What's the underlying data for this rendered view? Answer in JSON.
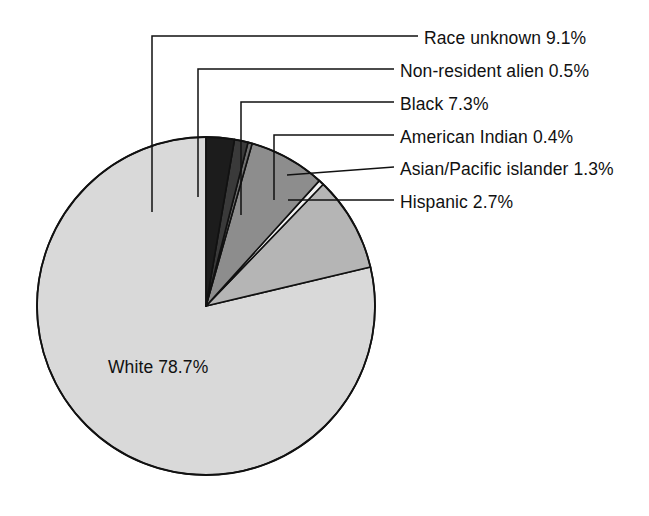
{
  "chart_data": {
    "type": "pie",
    "title": "",
    "subtitle": "",
    "xlabel": "",
    "ylabel": "",
    "legend_position": "callout-labels-right",
    "grid": false,
    "total_percent": 100.0,
    "categories": [
      "White",
      "Race unknown",
      "Non-resident alien",
      "Black",
      "American Indian",
      "Asian/Pacific islander",
      "Hispanic"
    ],
    "values": [
      78.7,
      9.1,
      0.5,
      7.3,
      0.4,
      1.3,
      2.7
    ],
    "slices": [
      {
        "name": "White",
        "value": 78.7,
        "label": "White 78.7%",
        "color": "#d9d9d9",
        "label_placement": "inside"
      },
      {
        "name": "Race unknown",
        "value": 9.1,
        "label": "Race unknown 9.1%",
        "color": "#b5b5b5",
        "label_placement": "callout"
      },
      {
        "name": "Non-resident alien",
        "value": 0.5,
        "label": "Non-resident alien 0.5%",
        "color": "#f2f2f2",
        "label_placement": "callout"
      },
      {
        "name": "Black",
        "value": 7.3,
        "label": "Black 7.3%",
        "color": "#8d8d8d",
        "label_placement": "callout"
      },
      {
        "name": "American Indian",
        "value": 0.4,
        "label": "American Indian 0.4%",
        "color": "#6f6f6f",
        "label_placement": "callout"
      },
      {
        "name": "Asian/Pacific islander",
        "value": 1.3,
        "label": "Asian/Pacific islander 1.3%",
        "color": "#3a3a3a",
        "label_placement": "callout"
      },
      {
        "name": "Hispanic",
        "value": 2.7,
        "label": "Hispanic 2.7%",
        "color": "#1c1c1c",
        "label_placement": "callout"
      }
    ],
    "geometry": {
      "center_x": 206,
      "center_y": 306,
      "radius": 169,
      "start_angle_deg": -90,
      "direction": "clockwise"
    },
    "callouts": [
      {
        "name": "Race unknown",
        "text_x": 424,
        "text_y": 28
      },
      {
        "name": "Non-resident alien",
        "text_x": 400,
        "text_y": 61
      },
      {
        "name": "Black",
        "text_x": 400,
        "text_y": 94
      },
      {
        "name": "American Indian",
        "text_x": 400,
        "text_y": 127
      },
      {
        "name": "Asian/Pacific islander",
        "text_x": 400,
        "text_y": 159
      },
      {
        "name": "Hispanic",
        "text_x": 400,
        "text_y": 192
      }
    ],
    "inside_label": {
      "name": "White",
      "text": "White 78.7%",
      "text_x": 108,
      "text_y": 357
    }
  }
}
